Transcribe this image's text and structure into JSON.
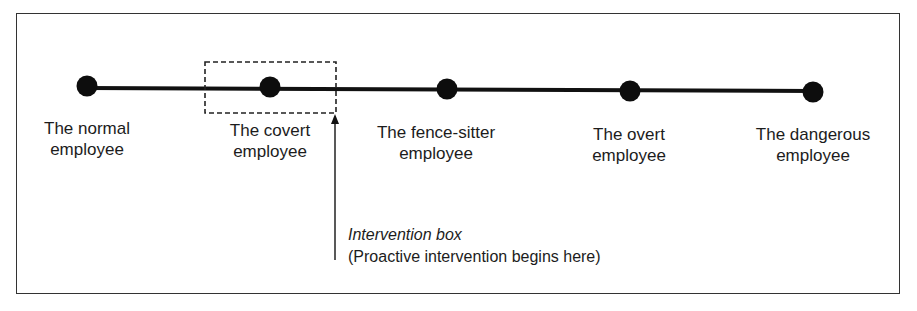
{
  "diagram": {
    "type": "continuum",
    "stages": [
      {
        "line1": "The normal",
        "line2": "employee",
        "x": 87
      },
      {
        "line1": "The covert",
        "line2": "employee",
        "x": 270
      },
      {
        "line1": "The fence-sitter",
        "line2": "employee",
        "x": 447
      },
      {
        "line1": "The overt",
        "line2": "employee",
        "x": 630
      },
      {
        "line1": "The dangerous",
        "line2": "employee",
        "x": 813
      }
    ],
    "intervention": {
      "title": "Intervention box",
      "description": "(Proactive intervention begins here)"
    }
  }
}
